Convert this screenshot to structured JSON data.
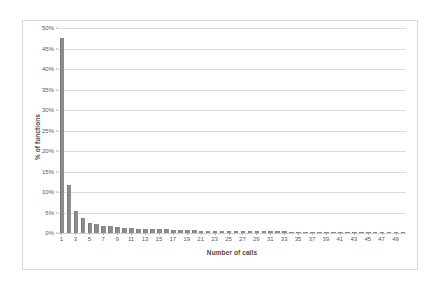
{
  "chart_data": {
    "type": "bar",
    "title": "",
    "xlabel": "Number of calls",
    "ylabel": "% of functions",
    "xlim": [
      0,
      50
    ],
    "ylim": [
      0,
      50
    ],
    "y_tick_labels": [
      "0%",
      "5%",
      "10%",
      "15%",
      "20%",
      "25%",
      "30%",
      "35%",
      "40%",
      "45%",
      "50%"
    ],
    "y_tick_values": [
      0,
      5,
      10,
      15,
      20,
      25,
      30,
      35,
      40,
      45,
      50
    ],
    "x_tick_labels": [
      "1",
      "3",
      "5",
      "7",
      "9",
      "11",
      "13",
      "15",
      "17",
      "19",
      "21",
      "23",
      "25",
      "27",
      "29",
      "31",
      "33",
      "35",
      "37",
      "39",
      "41",
      "43",
      "45",
      "47",
      "49"
    ],
    "x_tick_values": [
      1,
      3,
      5,
      7,
      9,
      11,
      13,
      15,
      17,
      19,
      21,
      23,
      25,
      27,
      29,
      31,
      33,
      35,
      37,
      39,
      41,
      43,
      45,
      47,
      49
    ],
    "grid": "horizontal",
    "legend": "none",
    "bar_color": "#8c8c8c",
    "gridline_color": "#dcdcdc",
    "border_color": "#d9d9d9",
    "text_color": "#595959",
    "categories": [
      1,
      2,
      3,
      4,
      5,
      6,
      7,
      8,
      9,
      10,
      11,
      12,
      13,
      14,
      15,
      16,
      17,
      18,
      19,
      20,
      21,
      22,
      23,
      24,
      25,
      26,
      27,
      28,
      29,
      30,
      31,
      32,
      33,
      34,
      35,
      36,
      37,
      38,
      39,
      40,
      41,
      42,
      43,
      44,
      45,
      46,
      47,
      48,
      49,
      50
    ],
    "values": [
      47.5,
      11.8,
      5.3,
      3.6,
      2.5,
      2.3,
      1.7,
      1.6,
      1.5,
      1.3,
      1.2,
      1.1,
      1.0,
      1.0,
      0.9,
      0.9,
      0.8,
      0.8,
      0.7,
      0.7,
      0.6,
      0.6,
      0.6,
      0.6,
      0.5,
      0.5,
      0.5,
      0.5,
      0.4,
      0.4,
      0.4,
      0.4,
      0.4,
      0.35,
      0.35,
      0.3,
      0.3,
      0.3,
      0.3,
      0.3,
      0.3,
      0.25,
      0.25,
      0.25,
      0.25,
      0.25,
      0.2,
      0.2,
      0.2,
      0.2
    ]
  }
}
